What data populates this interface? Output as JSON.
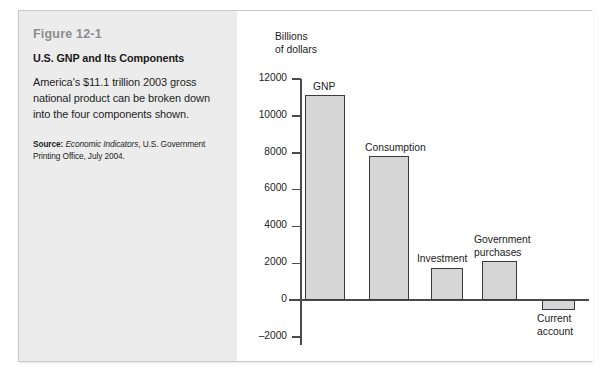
{
  "figure": {
    "number": "Figure 12-1",
    "title": "U.S. GNP and Its Components",
    "description": "America's $11.1 trillion 2003 gross national product can be broken down into the four components shown.",
    "source_label": "Source:",
    "source_italic": "Economic Indicators",
    "source_rest": ", U.S. Government Printing Office, July 2004."
  },
  "chart_data": {
    "type": "bar",
    "title": "U.S. GNP and Its Components",
    "xlabel": "",
    "ylabel": "Billions of dollars",
    "ylabel_line1": "Billions",
    "ylabel_line2": "of dollars",
    "ylim": [
      -2000,
      12000
    ],
    "ytick_labels": [
      "12000",
      "10000",
      "8000",
      "6000",
      "4000",
      "2000",
      "0",
      "–2000"
    ],
    "ytick_values": [
      12000,
      10000,
      8000,
      6000,
      4000,
      2000,
      0,
      -2000
    ],
    "grid": false,
    "legend": "none",
    "categories": [
      "GNP",
      "Consumption",
      "Investment",
      "Government purchases",
      "Current account"
    ],
    "values": [
      11100,
      7800,
      1750,
      2100,
      -550
    ],
    "bar_color": "#d6d6d6",
    "bar_edge_color": "#3b3b3b",
    "axis_color": "#4a4a4a",
    "labels": {
      "gnp": "GNP",
      "consumption": "Consumption",
      "investment": "Investment",
      "government_purchases": "Government\npurchases",
      "current_account": "Current\naccount"
    }
  }
}
